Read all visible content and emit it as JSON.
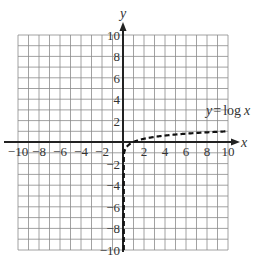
{
  "chart_data": {
    "type": "line",
    "title": "",
    "xlabel": "x",
    "ylabel": "y",
    "xlim": [
      -10,
      10
    ],
    "ylim": [
      -10,
      10
    ],
    "grid": true,
    "grid_step": 1,
    "x_ticks": [
      -10,
      -8,
      -6,
      -4,
      -2,
      2,
      4,
      6,
      8,
      10
    ],
    "y_ticks": [
      10,
      8,
      6,
      4,
      2,
      -2,
      -4,
      -6,
      -8,
      -10
    ],
    "x_tick_labels": [
      "−10",
      "−8",
      "−6",
      "−4",
      "−2",
      "2",
      "4",
      "6",
      "8",
      "10"
    ],
    "y_tick_labels": [
      "10",
      "8",
      "6",
      "4",
      "2",
      "−2",
      "−4",
      "−6",
      "−8",
      "−10"
    ],
    "series": [
      {
        "name": "y = log x",
        "style": "dashed",
        "function": "log10(x)",
        "x": [
          1e-10,
          0.001,
          0.01,
          0.1,
          0.2,
          0.5,
          1,
          2,
          4,
          6,
          8,
          10
        ],
        "y": [
          -10,
          -3,
          -2,
          -1,
          -0.7,
          -0.3,
          0,
          0.301,
          0.602,
          0.778,
          0.903,
          1
        ]
      }
    ],
    "annotations": [
      {
        "text": "y = log x",
        "x": 8.5,
        "y": 1.8
      }
    ]
  },
  "labels": {
    "x_axis": "x",
    "y_axis": "y",
    "curve_prefix": "y",
    "curve_eq": "=",
    "curve_fn": "log",
    "curve_var": "x"
  }
}
